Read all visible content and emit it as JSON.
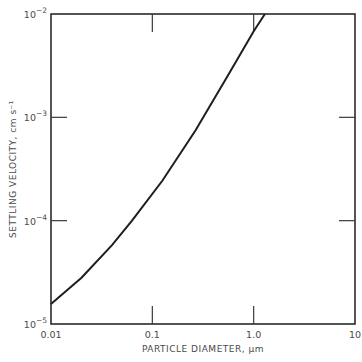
{
  "chart_data": {
    "type": "line",
    "title": "",
    "xlabel": "PARTICLE DIAMETER, µm",
    "ylabel": "SETTLING VELOCITY, cm s⁻¹",
    "xscale": "log",
    "yscale": "log",
    "xlim": [
      0.01,
      10
    ],
    "ylim": [
      1e-05,
      0.01
    ],
    "grid": false,
    "legend": "none",
    "x_ticks": [
      {
        "value": 0.01,
        "label": "0.01"
      },
      {
        "value": 0.1,
        "label": "0.1"
      },
      {
        "value": 1,
        "label": "1.0"
      },
      {
        "value": 10,
        "label": "10"
      }
    ],
    "y_ticks": [
      {
        "value": 1e-05,
        "base": "10",
        "exp": "-5"
      },
      {
        "value": 0.0001,
        "base": "10",
        "exp": "-4"
      },
      {
        "value": 0.001,
        "base": "10",
        "exp": "-3"
      },
      {
        "value": 0.01,
        "base": "10",
        "exp": "-2"
      }
    ],
    "series": [
      {
        "name": "settling velocity",
        "x": [
          0.01,
          0.02,
          0.04,
          0.063,
          0.126,
          0.267,
          0.565,
          1.0,
          1.29
        ],
        "y": [
          1.56e-05,
          2.8e-05,
          5.8e-05,
          0.0001,
          0.000245,
          0.00075,
          0.0026,
          0.0068,
          0.01
        ]
      }
    ]
  }
}
